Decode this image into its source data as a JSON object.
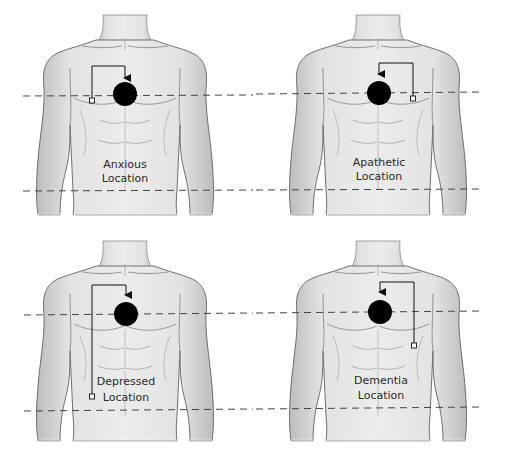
{
  "panels": [
    {
      "id": "anxious",
      "label_line1": "Anxious",
      "label_line2": "Location"
    },
    {
      "id": "apathetic",
      "label_line1": "Apathetic",
      "label_line2": "Location"
    },
    {
      "id": "depressed",
      "label_line1": "Depressed",
      "label_line2": "Location"
    },
    {
      "id": "dementia",
      "label_line1": "Dementia",
      "label_line2": "Location"
    }
  ],
  "colors": {
    "skin": "#e6e6e6",
    "outline": "#6f6f6f",
    "marker": "#000000",
    "dashed_line": "#444444"
  }
}
